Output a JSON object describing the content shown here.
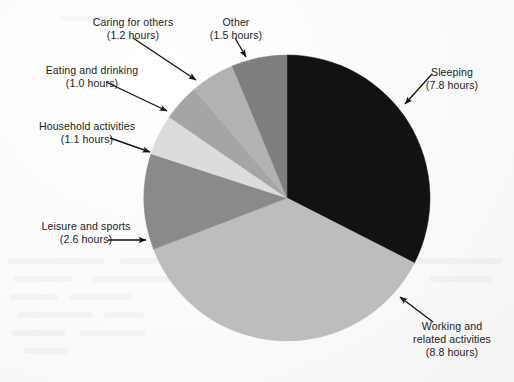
{
  "chart_data": {
    "type": "pie",
    "title": "",
    "subtitle": "",
    "unit": "hours",
    "total": 24.0,
    "legend_position": "callout-labels",
    "grid": false,
    "start_angle_deg": 0,
    "direction": "clockwise",
    "categories": [
      "Sleeping",
      "Working and related activities",
      "Leisure and sports",
      "Household activities",
      "Eating and drinking",
      "Caring for others",
      "Other"
    ],
    "values": [
      7.8,
      8.8,
      2.6,
      1.1,
      1.0,
      1.2,
      1.5
    ],
    "colors": [
      "#121212",
      "#bdbdbd",
      "#8a8a8a",
      "#dcdcdc",
      "#a5a5a5",
      "#b2b2b2",
      "#7e7e7e"
    ],
    "slices": [
      {
        "label": "Sleeping",
        "value": 7.8,
        "value_text": "(7.8 hours)",
        "color": "#121212"
      },
      {
        "label": "Working and related activities",
        "value": 8.8,
        "value_text": "(8.8 hours)",
        "color": "#bdbdbd"
      },
      {
        "label": "Leisure and sports",
        "value": 2.6,
        "value_text": "(2.6 hours)",
        "color": "#8a8a8a"
      },
      {
        "label": "Household activities",
        "value": 1.1,
        "value_text": "(1.1 hours)",
        "color": "#dcdcdc"
      },
      {
        "label": "Eating and drinking",
        "value": 1.0,
        "value_text": "(1.0 hours)",
        "color": "#a5a5a5"
      },
      {
        "label": "Caring for others",
        "value": 1.2,
        "value_text": "(1.2 hours)",
        "color": "#b2b2b2"
      },
      {
        "label": "Other",
        "value": 1.5,
        "value_text": "(1.5 hours)",
        "color": "#7e7e7e"
      }
    ]
  },
  "labels": {
    "caring": {
      "line1": "Caring for others",
      "line2": "(1.2 hours)"
    },
    "other": {
      "line1": "Other",
      "line2": "(1.5 hours)"
    },
    "eating": {
      "line1": "Eating and drinking",
      "line2": "(1.0 hours)"
    },
    "household": {
      "line1": "Household activities",
      "line2": "(1.1 hours)"
    },
    "leisure": {
      "line1": "Leisure and sports",
      "line2": "(2.6 hours)"
    },
    "sleeping": {
      "line1": "Sleeping",
      "line2": "(7.8 hours)"
    },
    "working": {
      "line1": "Working and",
      "line2": "related activities",
      "line3": "(8.8 hours)"
    }
  }
}
